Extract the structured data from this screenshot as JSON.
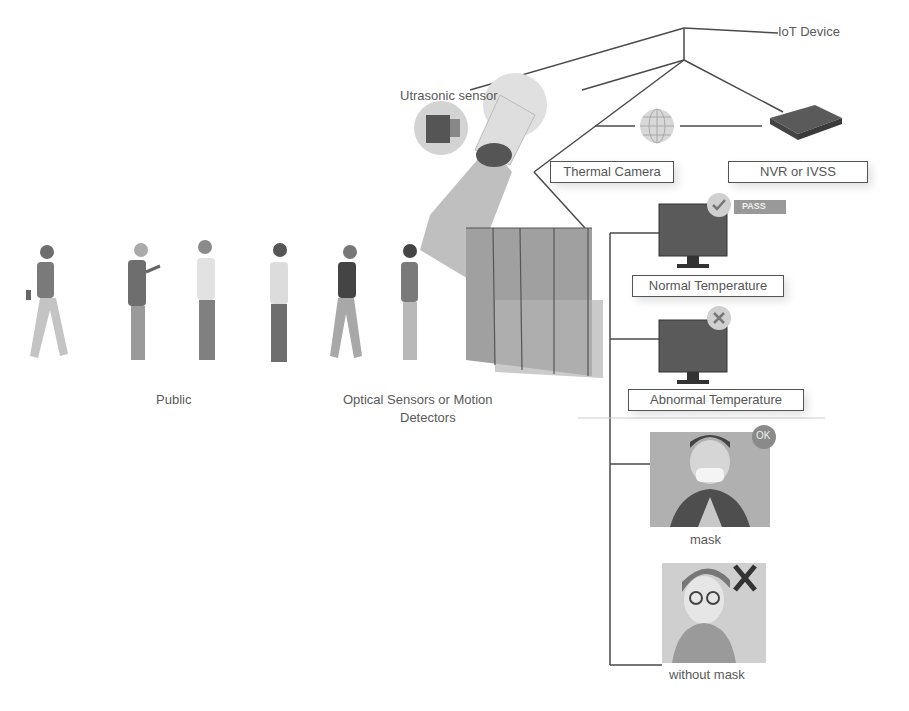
{
  "diagram": {
    "labels": {
      "iot_device": "IoT Device",
      "utrasonic_sensor": "Utrasonic sensor",
      "thermal_camera": "Thermal Camera",
      "nvr": "NVR or IVSS",
      "pass_badge": "PASS",
      "normal_temperature": "Normal Temperature",
      "abnormal_temperature": "Abnormal Temperature",
      "ok_badge": "OK",
      "mask": "mask",
      "without_mask": "without mask",
      "x_mark": "X",
      "public": "Public",
      "optical_sensors_line1": "Optical Sensors or Motion",
      "optical_sensors_line2": "Detectors"
    },
    "people_count": 6,
    "colors": {
      "line": "#4a4a4a",
      "figure_dark": "#6e6e6e",
      "figure_mid": "#9a9a9a",
      "figure_light": "#c8c8c8",
      "panel": "#a8a8a8",
      "badge": "#8a8a8a"
    }
  }
}
